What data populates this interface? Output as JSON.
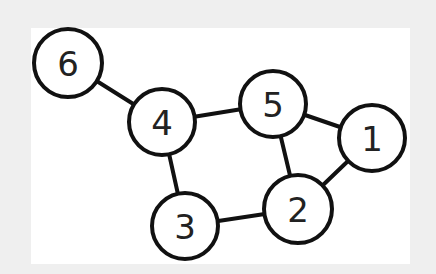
{
  "diagram": {
    "type": "undirected-graph",
    "background_color": "#efefef",
    "panel_color": "#ffffff",
    "stroke_color": "#111111",
    "nodes": [
      {
        "id": "1",
        "label": "1",
        "x": 372,
        "y": 138,
        "r": 33
      },
      {
        "id": "2",
        "label": "2",
        "x": 298,
        "y": 209,
        "r": 34
      },
      {
        "id": "3",
        "label": "3",
        "x": 185,
        "y": 226,
        "r": 33
      },
      {
        "id": "4",
        "label": "4",
        "x": 162,
        "y": 122,
        "r": 33
      },
      {
        "id": "5",
        "label": "5",
        "x": 273,
        "y": 104,
        "r": 33
      },
      {
        "id": "6",
        "label": "6",
        "x": 68,
        "y": 63,
        "r": 34
      }
    ],
    "edges": [
      {
        "from": "6",
        "to": "4"
      },
      {
        "from": "4",
        "to": "5"
      },
      {
        "from": "4",
        "to": "3"
      },
      {
        "from": "5",
        "to": "1"
      },
      {
        "from": "5",
        "to": "2"
      },
      {
        "from": "1",
        "to": "2"
      },
      {
        "from": "3",
        "to": "2"
      }
    ]
  }
}
